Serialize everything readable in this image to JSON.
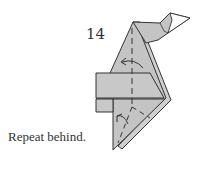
{
  "diagram": {
    "step_number": "14",
    "caption": "Repeat behind.",
    "colors": {
      "paper_fill": "#c4c4c4",
      "paper_light": "#d2d2d2",
      "line": "#333333",
      "white": "#ffffff"
    },
    "symbols": [
      "valley-fold-dashed-line",
      "fold-arrow-upper",
      "fold-arrow-lower"
    ]
  }
}
